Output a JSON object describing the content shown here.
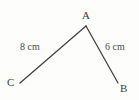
{
  "figure": {
    "type": "triangle-diagram",
    "background_color": "#fdfdfc",
    "stroke_color": "#3f3f3f",
    "label_color": "#3b3b3b",
    "vertices": {
      "A": {
        "label": "A",
        "x": 86,
        "y": 26
      },
      "B": {
        "label": "B",
        "x": 118,
        "y": 83
      },
      "C": {
        "label": "C",
        "x": 20,
        "y": 83
      }
    },
    "sides": [
      {
        "name": "side-CA",
        "label": "8 cm",
        "value": 8,
        "unit": "cm",
        "from": "C",
        "to": "A"
      },
      {
        "name": "side-AB",
        "label": "6 cm",
        "value": 6,
        "unit": "cm",
        "from": "A",
        "to": "B"
      },
      {
        "name": "side-CB",
        "label": "",
        "from": "C",
        "to": "B",
        "style": "gradient-thick"
      }
    ]
  }
}
